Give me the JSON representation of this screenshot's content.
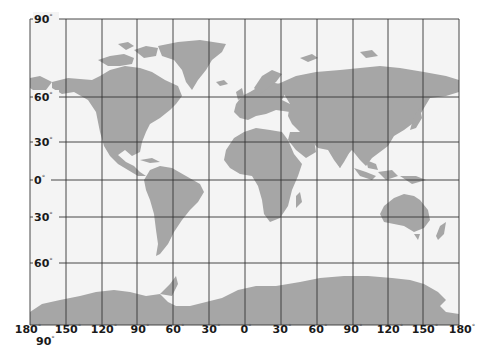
{
  "map": {
    "projection": "Mercator world map with graticule",
    "colors": {
      "background": "#ffffff",
      "ocean": "#f4f4f4",
      "land": "#a6a6a6",
      "grid": "#333333",
      "label": "#1a1a1a"
    },
    "latitude_labels": [
      {
        "value": "90",
        "y": 19
      },
      {
        "value": "60",
        "y": 97
      },
      {
        "value": "30",
        "y": 142
      },
      {
        "value": "0",
        "y": 180
      },
      {
        "value": "30",
        "y": 217
      },
      {
        "value": "30",
        "y": 217
      },
      {
        "value": "60",
        "y": 263
      }
    ],
    "lat_labels": [
      "90",
      "60",
      "30",
      "0",
      "30",
      "60"
    ],
    "bottom_lat_label": "90",
    "longitude_labels": [
      "180",
      "150",
      "120",
      "90",
      "60",
      "30",
      "0",
      "30",
      "60",
      "90",
      "120",
      "150",
      "180"
    ],
    "degree_symbol": "°"
  }
}
